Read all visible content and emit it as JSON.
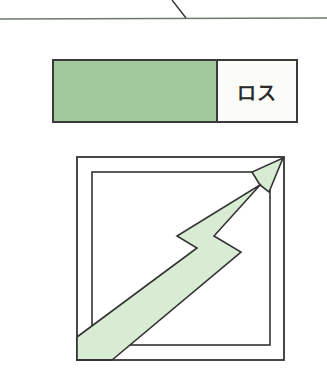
{
  "callout": {
    "line_color": "#5a6a5a"
  },
  "bar": {
    "gain_color": "#a2c99d",
    "loss_label": "ロス",
    "border_color": "#3a3a3a"
  },
  "growth_chart": {
    "arrow_fill": "#d8ecd4",
    "stroke_color": "#333333",
    "icon": "rising-zigzag-arrow-icon"
  }
}
